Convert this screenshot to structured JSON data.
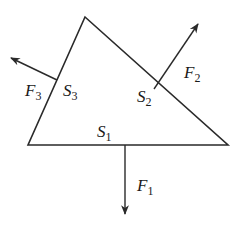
{
  "diagram": {
    "title": "",
    "colors": {
      "stroke": "#2a2a2a",
      "background": "#ffffff"
    },
    "shape": {
      "type": "triangle",
      "vertices": {
        "top": [
          85,
          17
        ],
        "left": [
          28,
          145
        ],
        "right": [
          228,
          145
        ]
      }
    },
    "faces": [
      {
        "id": "S1",
        "symbol": "S",
        "subscript": "1",
        "side": "bottom"
      },
      {
        "id": "S2",
        "symbol": "S",
        "subscript": "2",
        "side": "right"
      },
      {
        "id": "S3",
        "symbol": "S",
        "subscript": "3",
        "side": "left"
      }
    ],
    "forces": [
      {
        "id": "F1",
        "symbol": "F",
        "subscript": "1",
        "acts_on": "S1",
        "direction": "down"
      },
      {
        "id": "F2",
        "symbol": "F",
        "subscript": "2",
        "acts_on": "S2",
        "direction": "up-right"
      },
      {
        "id": "F3",
        "symbol": "F",
        "subscript": "3",
        "acts_on": "S3",
        "direction": "up-left"
      }
    ]
  }
}
